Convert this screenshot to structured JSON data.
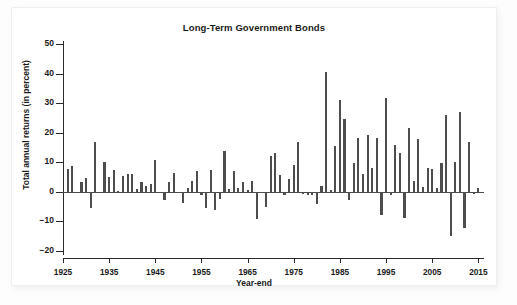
{
  "chart_data": {
    "type": "bar",
    "title": "Long-Term Government Bonds",
    "xlabel": "Year-end",
    "ylabel": "Total annual returns (in percent)",
    "ylim": [
      -20,
      50
    ],
    "yticks": [
      -20,
      -10,
      0,
      10,
      20,
      30,
      40,
      50
    ],
    "ytick_labels": [
      "−20",
      "−10",
      "0",
      "10",
      "20",
      "30",
      "40",
      "50"
    ],
    "xlim": [
      1925,
      2016
    ],
    "xticks": [
      1925,
      1935,
      1945,
      1955,
      1965,
      1975,
      1985,
      1995,
      2005,
      2015
    ],
    "xtick_labels": [
      "1925",
      "1935",
      "1945",
      "1955",
      "1965",
      "1975",
      "1985",
      "1995",
      "2005",
      "2015"
    ],
    "grid": false,
    "legend": "none",
    "bar_color": "#4d4d4d",
    "categories": [
      1926,
      1927,
      1928,
      1929,
      1930,
      1931,
      1932,
      1933,
      1934,
      1935,
      1936,
      1937,
      1938,
      1939,
      1940,
      1941,
      1942,
      1943,
      1944,
      1945,
      1946,
      1947,
      1948,
      1949,
      1950,
      1951,
      1952,
      1953,
      1954,
      1955,
      1956,
      1957,
      1958,
      1959,
      1960,
      1961,
      1962,
      1963,
      1964,
      1965,
      1966,
      1967,
      1968,
      1969,
      1970,
      1971,
      1972,
      1973,
      1974,
      1975,
      1976,
      1977,
      1978,
      1979,
      1980,
      1981,
      1982,
      1983,
      1984,
      1985,
      1986,
      1987,
      1988,
      1989,
      1990,
      1991,
      1992,
      1993,
      1994,
      1995,
      1996,
      1997,
      1998,
      1999,
      2000,
      2001,
      2002,
      2003,
      2004,
      2005,
      2006,
      2007,
      2008,
      2009,
      2010,
      2011,
      2012,
      2013,
      2014,
      2015
    ],
    "values": [
      7.8,
      8.9,
      0.1,
      3.4,
      4.7,
      -5.3,
      16.8,
      -0.1,
      10.0,
      5.0,
      7.5,
      0.2,
      5.5,
      5.9,
      6.1,
      0.9,
      3.2,
      2.1,
      2.8,
      10.7,
      -0.1,
      -2.6,
      3.4,
      6.4,
      0.1,
      -3.9,
      1.2,
      3.6,
      7.2,
      -1.2,
      -5.6,
      7.5,
      -6.1,
      -2.3,
      13.8,
      0.9,
      6.9,
      1.2,
      3.5,
      0.7,
      3.6,
      -9.2,
      -0.3,
      -5.1,
      12.1,
      13.2,
      5.7,
      -1.1,
      4.3,
      9.2,
      16.8,
      -0.7,
      -1.2,
      -1.2,
      -4.0,
      1.9,
      40.4,
      0.7,
      15.5,
      31.0,
      24.5,
      -2.7,
      9.7,
      18.1,
      6.2,
      19.3,
      8.1,
      18.2,
      -7.8,
      31.7,
      -0.9,
      15.9,
      13.1,
      -9.0,
      21.5,
      3.7,
      17.8,
      1.5,
      8.1,
      7.8,
      1.2,
      9.9,
      25.9,
      -14.9,
      10.1,
      27.1,
      -12.1,
      17.0,
      -0.8,
      1.3
    ]
  },
  "figure": {
    "background": "#ffffff",
    "panel_border": "#efefef"
  }
}
